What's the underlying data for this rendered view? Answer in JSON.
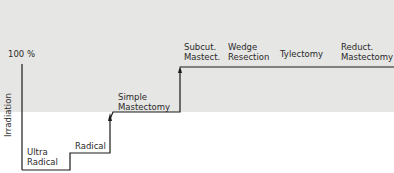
{
  "diagram": {
    "axis_label": "100 %",
    "side_label": "Irradiation",
    "steps": [
      {
        "line1": "Ultra",
        "line2": "Radical"
      },
      {
        "line1": "Radical",
        "line2": ""
      },
      {
        "line1": "Simple",
        "line2": "Mastectomy"
      },
      {
        "line1": "Subcut.",
        "line2": "Mastect."
      },
      {
        "line1": "Wedge",
        "line2": "Resection"
      },
      {
        "line1": "Tylectomy",
        "line2": ""
      },
      {
        "line1": "Reduct.",
        "line2": "Mastectomy"
      }
    ],
    "colors": {
      "band": "#e6e6e4",
      "line": "#1a1a1a"
    }
  }
}
